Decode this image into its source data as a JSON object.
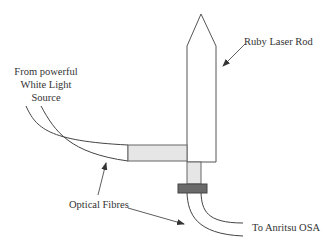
{
  "diagram": {
    "labels": {
      "rod": "Ruby Laser Rod",
      "source_line1": "From powerful",
      "source_line2": "White Light",
      "source_line3": "Source",
      "fibres": "Optical Fibres",
      "osa": "To Anritsu OSA"
    },
    "colors": {
      "stroke": "#555555",
      "fill_gray": "#e6e6e6",
      "connector": "#6a6a6a",
      "text": "#333333"
    }
  }
}
